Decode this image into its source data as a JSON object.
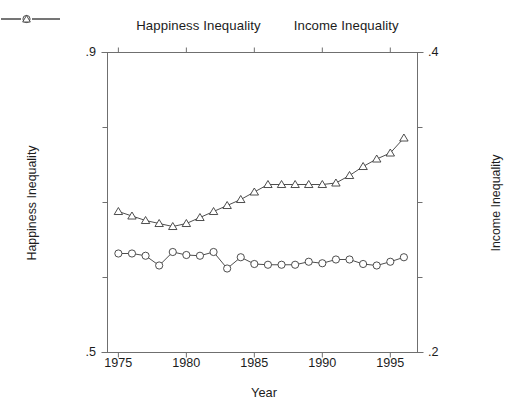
{
  "chart_data": {
    "type": "line",
    "title": "",
    "xlabel": "Year",
    "ylabel": "Happiness Inequality",
    "ylabel_right": "Income Inequality",
    "grid": false,
    "legend_position": "top-center",
    "x": [
      1975,
      1976,
      1977,
      1978,
      1979,
      1980,
      1981,
      1982,
      1983,
      1984,
      1985,
      1986,
      1987,
      1988,
      1989,
      1990,
      1991,
      1992,
      1993,
      1994,
      1995,
      1996
    ],
    "xlim": [
      1974.2,
      1997.0
    ],
    "xticks": [
      1975,
      1980,
      1985,
      1990,
      1995
    ],
    "xtick_labels": [
      "1975",
      "1980",
      "1985",
      "1990",
      "1995"
    ],
    "ylim_left": [
      0.5,
      0.9
    ],
    "yticks_left": [
      0.5,
      0.9
    ],
    "ytick_labels_left": [
      ".5",
      ".9"
    ],
    "yminor_left": [
      0.6,
      0.7,
      0.8
    ],
    "ylim_right": [
      0.2,
      0.4
    ],
    "yticks_right": [
      0.2,
      0.4
    ],
    "ytick_labels_right": [
      ".2",
      ".4"
    ],
    "yminor_right": [
      0.25,
      0.3,
      0.35
    ],
    "series": [
      {
        "name": "Happiness Inequality",
        "axis": "left",
        "marker": "circle",
        "values": [
          0.632,
          0.632,
          0.629,
          0.616,
          0.634,
          0.63,
          0.629,
          0.634,
          0.612,
          0.627,
          0.618,
          0.617,
          0.617,
          0.617,
          0.621,
          0.619,
          0.624,
          0.624,
          0.618,
          0.616,
          0.621,
          0.627
        ]
      },
      {
        "name": "Income Inequality",
        "axis": "right",
        "marker": "triangle",
        "values": [
          0.294,
          0.291,
          0.288,
          0.286,
          0.284,
          0.286,
          0.29,
          0.294,
          0.298,
          0.302,
          0.307,
          0.312,
          0.312,
          0.312,
          0.312,
          0.312,
          0.313,
          0.318,
          0.324,
          0.329,
          0.333,
          0.343
        ]
      }
    ]
  },
  "legend": {
    "items": [
      {
        "label": "Happiness Inequality",
        "marker": "circle"
      },
      {
        "label": "Income Inequality",
        "marker": "triangle"
      }
    ]
  },
  "axes": {
    "x_title": "Year",
    "y_left_title": "Happiness Inequality",
    "y_right_title": "Income Inequality",
    "y_left_top": ".9",
    "y_left_bottom": ".5",
    "y_right_top": ".4",
    "y_right_bottom": ".2",
    "x_tick_1": "1975",
    "x_tick_2": "1980",
    "x_tick_3": "1985",
    "x_tick_4": "1990",
    "x_tick_5": "1995"
  },
  "colors": {
    "line": "#3a3a3a",
    "frame": "#6f6f6f",
    "text": "#1c1c1c",
    "background": "#ffffff"
  }
}
